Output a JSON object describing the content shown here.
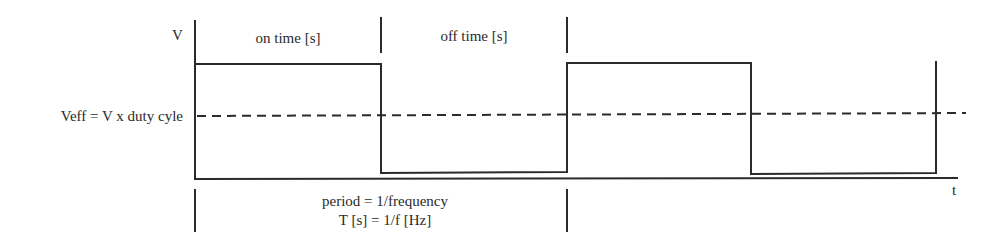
{
  "diagram": {
    "axes": {
      "y_label": "V",
      "x_label": "t"
    },
    "labels": {
      "on_time": "on time [s]",
      "off_time": "off time [s]",
      "effective_voltage": "Veff = V x duty cyle",
      "period_line1": "period = 1/frequency",
      "period_line2": "T [s] = 1/f [Hz]"
    },
    "colors": {
      "line": "#2b2b2b",
      "text": "#2a2a2a",
      "background": "#ffffff"
    },
    "waveform": {
      "type": "square",
      "cycles_shown": 2,
      "levels": [
        "high",
        "low",
        "high",
        "low",
        "high"
      ],
      "effective_level": "dashed line"
    }
  }
}
